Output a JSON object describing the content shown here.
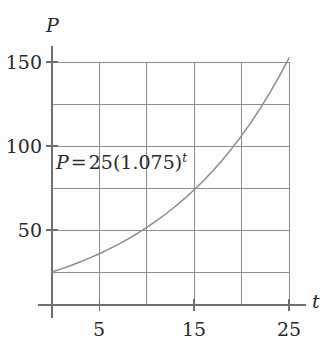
{
  "chart_data": {
    "type": "line",
    "title": "",
    "subtitle": "",
    "xlabel": "t",
    "ylabel": "P",
    "xlim": [
      0,
      25
    ],
    "ylim": [
      0,
      162
    ],
    "grid": true,
    "legend_position": "none",
    "annotations": [
      {
        "name": "equation-annotation",
        "text": "P = 25(1.075)^t",
        "parts": {
          "lhs": "P",
          "equals": "=",
          "coefficient": "25",
          "open_paren": "(",
          "base": "1.075",
          "close_paren": ")",
          "exponent": "t"
        },
        "x": 0.5,
        "y": 88
      }
    ],
    "x_ticks": [
      {
        "value": 0,
        "label": ""
      },
      {
        "value": 5,
        "label": "5"
      },
      {
        "value": 10,
        "label": ""
      },
      {
        "value": 15,
        "label": "15"
      },
      {
        "value": 20,
        "label": ""
      },
      {
        "value": 25,
        "label": "25"
      }
    ],
    "y_ticks": [
      {
        "value": 25,
        "label": ""
      },
      {
        "value": 50,
        "label": "50"
      },
      {
        "value": 75,
        "label": ""
      },
      {
        "value": 100,
        "label": "100"
      },
      {
        "value": 125,
        "label": ""
      },
      {
        "value": 150,
        "label": "150"
      }
    ],
    "x_gridlines": [
      0,
      5,
      10,
      15,
      20,
      25
    ],
    "y_gridlines": [
      25,
      50,
      75,
      100,
      125,
      150
    ],
    "series": [
      {
        "name": "P = 25(1.075)^t",
        "formula": "25 * 1.075^t",
        "x": [
          0,
          1,
          2,
          3,
          4,
          5,
          6,
          7,
          8,
          9,
          10,
          11,
          12,
          13,
          14,
          15,
          16,
          17,
          18,
          19,
          20,
          21,
          22,
          23,
          24,
          25
        ],
        "y": [
          25.0,
          26.88,
          28.89,
          31.06,
          33.39,
          35.89,
          38.58,
          41.47,
          44.58,
          47.92,
          51.52,
          55.38,
          59.53,
          63.99,
          68.79,
          73.95,
          79.49,
          85.45,
          91.85,
          98.74,
          106.14,
          114.1,
          122.66,
          131.86,
          141.75,
          152.38
        ]
      }
    ],
    "colors": {
      "curve": "#8c8c8c",
      "grid": "#8e8e8e",
      "axis": "#6f6f6f",
      "text": "#2b2b2b",
      "background": "#fdfdfd"
    }
  },
  "labels": {
    "y_axis_name": "P",
    "x_axis_name": "t",
    "y_tick_150": "150",
    "y_tick_100": "100",
    "y_tick_50": "50",
    "x_tick_5": "5",
    "x_tick_15": "15",
    "x_tick_25": "25"
  },
  "equation": {
    "lhs": "P",
    "equals": "=",
    "coefficient": "25",
    "open_paren": "(",
    "base": "1.075",
    "close_paren": ")",
    "exponent": "t"
  }
}
